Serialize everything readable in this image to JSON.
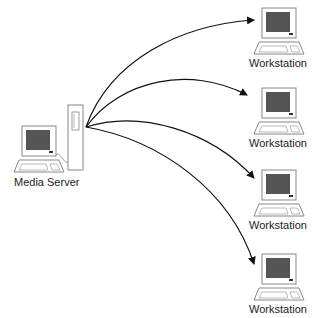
{
  "diagram": {
    "server": {
      "label": "Media Server"
    },
    "workstations": [
      {
        "label": "Workstation"
      },
      {
        "label": "Workstation"
      },
      {
        "label": "Workstation"
      },
      {
        "label": "Workstation"
      }
    ],
    "colors": {
      "line": "#111111",
      "screen": "#555555",
      "outline": "#888888"
    }
  }
}
